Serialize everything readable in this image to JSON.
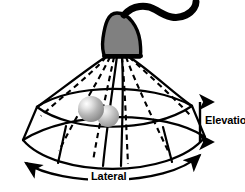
{
  "figure": {
    "name": "ultrasound-transducer-scan-volume-diagram",
    "background_color": "#ffffff",
    "stroke_color": "#000000",
    "labels": {
      "elevation": "Elevation",
      "lateral": "Lateral"
    },
    "parts": {
      "probe_head": {
        "name": "transducer-probe-head",
        "fill_color": "#808080",
        "outline_color": "#000000"
      },
      "cable": {
        "name": "probe-cable",
        "color": "#000000"
      },
      "scan_volume": {
        "name": "fan-shaped-scan-volume",
        "line_style": "solid",
        "color": "#000000"
      },
      "scan_lines": {
        "name": "dashed-beam-lines",
        "line_style": "dashed",
        "color": "#000000",
        "count": 6
      },
      "targets": [
        {
          "name": "target-sphere-large",
          "fill_color": "#a8a8a8",
          "highlight_color": "#f2f2f2"
        },
        {
          "name": "target-sphere-small",
          "fill_color": "#a8a8a8",
          "highlight_color": "#e8e8e8"
        }
      ],
      "elevation_arrow": {
        "name": "elevation-double-arrow",
        "orientation": "vertical",
        "color": "#000000"
      },
      "lateral_arrow": {
        "name": "lateral-curved-double-arrow",
        "orientation": "curved-horizontal",
        "color": "#000000"
      }
    }
  }
}
